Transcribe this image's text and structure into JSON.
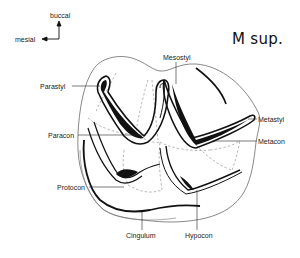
{
  "title": "M sup.",
  "orientation": {
    "vertical": "buccal",
    "horizontal": "mesial"
  },
  "labels": {
    "mesostyl": "Mesostyl",
    "parastyl": "Parastyl",
    "metastyl": "Metastyl",
    "paracon": "Paracon",
    "metacon": "Metacon",
    "protocon": "Protocon",
    "cingulum": "Cingulum",
    "hypocon": "Hypocon"
  }
}
